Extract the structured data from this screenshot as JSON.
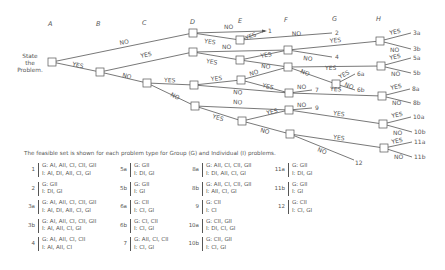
{
  "diagram": {
    "columns": [
      "A",
      "B",
      "C",
      "D",
      "E",
      "F",
      "G",
      "H"
    ],
    "start_label": [
      "State",
      "the",
      "Problem."
    ],
    "nodes": {
      "A": [
        52,
        62
      ],
      "B": [
        100,
        72
      ],
      "C": [
        147,
        83
      ],
      "D1": [
        193,
        33
      ],
      "D2": [
        193,
        52
      ],
      "D3": [
        194,
        85
      ],
      "D4": [
        195,
        106
      ],
      "E1": [
        240,
        40
      ],
      "E2": [
        240,
        60
      ],
      "E3": [
        241,
        80
      ],
      "E4": [
        242,
        121
      ],
      "F2": [
        288,
        50
      ],
      "F3": [
        288,
        67
      ],
      "F7": [
        289,
        93
      ],
      "F9": [
        289,
        110
      ],
      "F12": [
        290,
        134
      ],
      "G6": [
        336,
        84
      ],
      "H3": [
        380,
        41
      ],
      "H5": [
        381,
        66
      ],
      "H8": [
        382,
        96
      ],
      "H10": [
        383,
        124
      ],
      "H11": [
        384,
        148
      ]
    },
    "edges": [
      {
        "from": "A",
        "to": "D1",
        "label": "NO"
      },
      {
        "from": "A",
        "to": "B",
        "label": "YES"
      },
      {
        "from": "B",
        "to": "D2",
        "label": "YES"
      },
      {
        "from": "B",
        "to": "C",
        "label": "NO"
      },
      {
        "from": "C",
        "to": "D3",
        "label": "YES"
      },
      {
        "from": "C",
        "to": "D4",
        "label": "NO"
      },
      {
        "from": "D1",
        "to": "T1",
        "label": "NO"
      },
      {
        "from": "D1",
        "to": "E1",
        "label": "YES"
      },
      {
        "from": "E1",
        "to": "T1",
        "label": "YES"
      },
      {
        "from": "E1",
        "to": "T2",
        "label": "NO"
      },
      {
        "from": "D2",
        "to": "F2",
        "label": "NO"
      },
      {
        "from": "D2",
        "to": "E2",
        "label": "YES"
      },
      {
        "from": "E2",
        "to": "F3",
        "label": "YES"
      },
      {
        "from": "E2",
        "to": "F3b",
        "label": "NO"
      },
      {
        "from": "F2",
        "to": "H3",
        "label": "YES"
      },
      {
        "from": "F2",
        "to": "T4",
        "label": "NO"
      },
      {
        "from": "F3",
        "to": "H5",
        "label": "YES"
      },
      {
        "from": "F3",
        "to": "G6",
        "label": "NO"
      },
      {
        "from": "D3",
        "to": "E3",
        "label": "YES"
      },
      {
        "from": "D3",
        "to": "F7",
        "label": "NO"
      },
      {
        "from": "E3",
        "to": "F3",
        "label": "NO"
      },
      {
        "from": "E3",
        "to": "F7",
        "label": "YES"
      },
      {
        "from": "F7",
        "to": "T7",
        "label": "NO"
      },
      {
        "from": "F7",
        "to": "H8",
        "label": "YES"
      },
      {
        "from": "D4",
        "to": "F9",
        "label": "NO"
      },
      {
        "from": "D4",
        "to": "E4",
        "label": "YES"
      },
      {
        "from": "E4",
        "to": "F9",
        "label": "YES"
      },
      {
        "from": "E4",
        "to": "F12",
        "label": "NO"
      },
      {
        "from": "F9",
        "to": "T9",
        "label": "NO"
      },
      {
        "from": "F9",
        "to": "H10",
        "label": "YES"
      },
      {
        "from": "F12",
        "to": "H11",
        "label": "YES"
      },
      {
        "from": "F12",
        "to": "T12",
        "label": "NO"
      }
    ],
    "terminals": {
      "T1": {
        "label": "1",
        "pos": [
          268,
          31
        ]
      },
      "T2": {
        "label": "2",
        "pos": [
          335,
          33
        ]
      },
      "T4": {
        "label": "4",
        "pos": [
          335,
          57
        ]
      },
      "T6a": {
        "label": "6a",
        "pos": [
          358,
          74
        ]
      },
      "T6b": {
        "label": "6b",
        "pos": [
          358,
          90
        ]
      },
      "T7": {
        "label": "7",
        "pos": [
          315,
          90
        ]
      },
      "T9": {
        "label": "9",
        "pos": [
          315,
          108
        ]
      },
      "T12": {
        "label": "12",
        "pos": [
          357,
          162
        ]
      },
      "T3a": {
        "label": "3a",
        "pos": [
          414,
          33
        ]
      },
      "T3b": {
        "label": "3b",
        "pos": [
          414,
          49
        ]
      },
      "T5a": {
        "label": "5a",
        "pos": [
          414,
          58
        ]
      },
      "T5b": {
        "label": "5b",
        "pos": [
          414,
          73
        ]
      },
      "T8a": {
        "label": "8a",
        "pos": [
          413,
          89
        ]
      },
      "T8b": {
        "label": "8b",
        "pos": [
          414,
          103
        ]
      },
      "T10a": {
        "label": "10a",
        "pos": [
          414,
          117
        ]
      },
      "T10b": {
        "label": "10b",
        "pos": [
          415,
          132
        ]
      },
      "T11a": {
        "label": "11a",
        "pos": [
          415,
          142
        ]
      },
      "T11b": {
        "label": "11b",
        "pos": [
          415,
          157
        ]
      }
    },
    "branch_labels": {
      "yes": "YES",
      "no": "NO"
    }
  },
  "caption": "The feasible set is shown for each problem type for Group (G) and Individual (I) problems.",
  "legend": {
    "columns": [
      [
        {
          "id": "1",
          "g": "G:  AI, AII, CI, CII, GII",
          "i": "I:   AI, DI, AII, CI, GI"
        },
        {
          "id": "2",
          "g": "G:  GII",
          "i": "I:   DI, GI"
        },
        {
          "id": "3a",
          "g": "G:  AI, AII, CI, CII, GII",
          "i": "I:   AI, DI, AII, CI, GI"
        },
        {
          "id": "3b",
          "g": "G:  AI, AII, CI, CII, GII",
          "i": "I:   AI, AII, CI, GI"
        },
        {
          "id": "4",
          "g": "G:  AI, AII, CI, CII",
          "i": "I:   AI, AII, CI"
        }
      ],
      [
        {
          "id": "5a",
          "g": "G:  GII",
          "i": "I:   DI, GI"
        },
        {
          "id": "5b",
          "g": "G:  GII",
          "i": "I:   GI"
        },
        {
          "id": "6a",
          "g": "G:  CII",
          "i": "I:   CI, GI"
        },
        {
          "id": "6b",
          "g": "G:  CI, CII",
          "i": "I:   CI, GI"
        },
        {
          "id": "7",
          "g": "G:  AII, CI, CII",
          "i": "I:   CI, GI"
        }
      ],
      [
        {
          "id": "8a",
          "g": "G:  AII, CI, CII, GII",
          "i": "I:   DI, AII, CI, GI"
        },
        {
          "id": "8b",
          "g": "G:  AII, CI, CII, GII",
          "i": "I:   AII, CI, GI"
        },
        {
          "id": "9",
          "g": "G:  CII",
          "i": "I:   CI"
        },
        {
          "id": "10a",
          "g": "G:  CII, GII",
          "i": "I:   DI, CI, GI"
        },
        {
          "id": "10b",
          "g": "G:  CII, GII",
          "i": "I:   CI, GI"
        }
      ],
      [
        {
          "id": "11a",
          "g": "G:  GII",
          "i": "I:   DI, GI"
        },
        {
          "id": "11b",
          "g": "G:  GII",
          "i": "I:   GI"
        },
        {
          "id": "12",
          "g": "G:  CII",
          "i": "I:   CI, GI"
        }
      ]
    ]
  }
}
